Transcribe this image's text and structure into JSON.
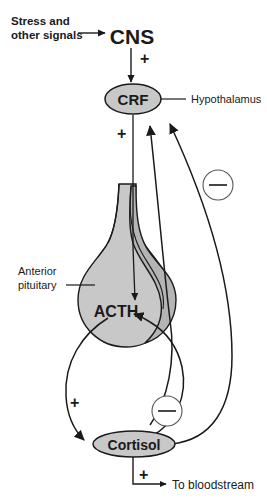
{
  "figure": {
    "background_color": "#ffffff",
    "line_color": "#1a1a1a",
    "shape_fill": "#c8c8c8"
  },
  "labels": {
    "stress_line1": "Stress and",
    "stress_line2": "other signals",
    "cns": "CNS",
    "crf": "CRF",
    "hypothalamus": "Hypothalamus",
    "anterior_line1": "Anterior",
    "anterior_line2": "pituitary",
    "acth": "ACTH",
    "cortisol": "Cortisol",
    "to_bloodstream": "To bloodstream"
  },
  "signs": {
    "plus_cns_to_crf": "+",
    "plus_crf_to_acth": "+",
    "plus_acth_to_cortisol": "+",
    "plus_cortisol_to_blood": "+",
    "minus_cortisol_to_crf": "−",
    "minus_cortisol_to_acth": "−"
  },
  "nodes": [
    {
      "id": "cns",
      "label": "CNS",
      "shape": "text"
    },
    {
      "id": "crf",
      "label": "CRF",
      "shape": "ellipse",
      "organ": "Hypothalamus"
    },
    {
      "id": "acth",
      "label": "ACTH",
      "shape": "gland",
      "organ": "Anterior pituitary"
    },
    {
      "id": "cortisol",
      "label": "Cortisol",
      "shape": "ellipse"
    }
  ],
  "edges": [
    {
      "from": "Stress and other signals",
      "to": "CNS",
      "sign": ""
    },
    {
      "from": "CNS",
      "to": "CRF",
      "sign": "+"
    },
    {
      "from": "CRF",
      "to": "ACTH",
      "sign": "+"
    },
    {
      "from": "ACTH",
      "to": "Cortisol",
      "sign": "+"
    },
    {
      "from": "Cortisol",
      "to": "To bloodstream",
      "sign": "+"
    },
    {
      "from": "Cortisol",
      "to": "CRF",
      "sign": "−"
    },
    {
      "from": "Cortisol",
      "to": "ACTH",
      "sign": "−"
    }
  ]
}
